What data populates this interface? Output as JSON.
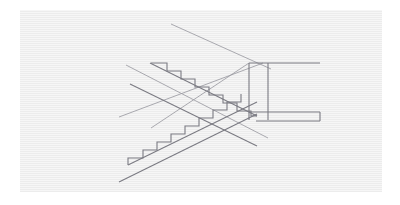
{
  "document": {
    "title": "Staircase Line Drawing",
    "type": "technical-line-drawing",
    "subject": "double-flight switchback staircase, axonometric projection"
  },
  "canvas": {
    "width": 400,
    "height": 205,
    "background_color": "#ffffff"
  },
  "panel": {
    "x": 20,
    "y": 10,
    "width": 362,
    "height": 182,
    "fill_color": "#ececec"
  },
  "style": {
    "line_color": "#7a7a82",
    "line_color_light": "#9b9ba2",
    "stroke_width": 1.1,
    "thin_stroke_width": 0.85
  },
  "chart_data": {
    "type": "line",
    "xlabel": "",
    "ylabel": "",
    "xlim": [
      0,
      362
    ],
    "ylim": [
      0,
      182
    ],
    "grid": false,
    "legend": null,
    "note": "Coordinates are in panel-local pixel space (origin at panel top-left).",
    "series": [
      {
        "name": "upper-flight-stringer-top",
        "kind": "polyline",
        "points": [
          [
            130,
            53
          ],
          [
            237,
            106
          ]
        ]
      },
      {
        "name": "upper-flight-stringer-bottom",
        "kind": "polyline",
        "points": [
          [
            110,
            74
          ],
          [
            237,
            136
          ]
        ]
      },
      {
        "name": "upper-flight-treads-risers",
        "kind": "step-polyline",
        "step_count": 9,
        "points": [
          [
            131,
            53
          ],
          [
            147,
            53
          ],
          [
            147,
            61
          ],
          [
            161,
            61
          ],
          [
            161,
            69
          ],
          [
            175,
            69
          ],
          [
            175,
            77
          ],
          [
            189,
            77
          ],
          [
            189,
            85
          ],
          [
            203,
            85
          ],
          [
            203,
            93
          ],
          [
            217,
            93
          ],
          [
            217,
            101
          ],
          [
            231,
            101
          ],
          [
            231,
            106
          ],
          [
            237,
            106
          ]
        ]
      },
      {
        "name": "lower-flight-stringer-top",
        "kind": "polyline",
        "points": [
          [
            108,
            155
          ],
          [
            237,
            92
          ]
        ]
      },
      {
        "name": "lower-flight-stringer-bottom",
        "kind": "polyline",
        "points": [
          [
            99,
            172
          ],
          [
            237,
            104
          ]
        ]
      },
      {
        "name": "lower-flight-treads-risers",
        "kind": "step-polyline",
        "step_count": 8,
        "points": [
          [
            108,
            155
          ],
          [
            108,
            148
          ],
          [
            123,
            148
          ],
          [
            123,
            140
          ],
          [
            137,
            140
          ],
          [
            137,
            132
          ],
          [
            151,
            132
          ],
          [
            151,
            124
          ],
          [
            165,
            124
          ],
          [
            165,
            116
          ],
          [
            179,
            116
          ],
          [
            179,
            108
          ],
          [
            193,
            108
          ],
          [
            193,
            100
          ],
          [
            207,
            100
          ],
          [
            207,
            92
          ],
          [
            221,
            92
          ],
          [
            221,
            84
          ]
        ]
      },
      {
        "name": "landing-shaft-left-edge",
        "kind": "polyline",
        "points": [
          [
            229,
            53
          ],
          [
            229,
            110
          ]
        ]
      },
      {
        "name": "landing-shaft-right-edge",
        "kind": "polyline",
        "points": [
          [
            248,
            53
          ],
          [
            248,
            110
          ]
        ]
      },
      {
        "name": "landing-top-rail",
        "kind": "polyline",
        "points": [
          [
            229,
            53
          ],
          [
            300,
            53
          ]
        ]
      },
      {
        "name": "landing-bottom-slab-top",
        "kind": "polyline",
        "points": [
          [
            229,
            102
          ],
          [
            300,
            102
          ]
        ]
      },
      {
        "name": "landing-bottom-slab-bottom",
        "kind": "polyline",
        "points": [
          [
            236,
            111
          ],
          [
            300,
            111
          ]
        ]
      },
      {
        "name": "landing-bottom-slab-right-cap",
        "kind": "polyline",
        "points": [
          [
            300,
            102
          ],
          [
            300,
            111
          ]
        ]
      },
      {
        "name": "construction-line-upper-long",
        "kind": "polyline",
        "points": [
          [
            151,
            14
          ],
          [
            251,
            59
          ]
        ]
      },
      {
        "name": "construction-line-descending",
        "kind": "polyline",
        "points": [
          [
            106,
            55
          ],
          [
            248,
            128
          ]
        ]
      },
      {
        "name": "construction-line-ascending",
        "kind": "polyline",
        "points": [
          [
            99,
            107
          ],
          [
            243,
            53
          ]
        ]
      },
      {
        "name": "construction-line-lower-diagonal",
        "kind": "polyline",
        "points": [
          [
            131,
            118
          ],
          [
            229,
            53
          ]
        ]
      }
    ]
  },
  "elements": {
    "upper_flight_label": "upper flight",
    "lower_flight_label": "lower flight",
    "landing_label": "landing shaft",
    "construction_lines_label": "construction lines"
  }
}
